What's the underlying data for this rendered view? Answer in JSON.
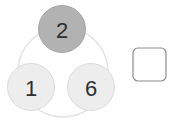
{
  "figure": {
    "type": "number-circle-puzzle",
    "background_color": "#ffffff",
    "guide_circle": {
      "name": "guide-circle",
      "cx": 63,
      "cy": 72,
      "r": 45,
      "stroke_color": "#e4e4e4",
      "stroke_width": 1.4,
      "fill": "none"
    },
    "nodes": [
      {
        "id": "node-top",
        "label": "2",
        "cx": 62,
        "cy": 29,
        "r": 23.5,
        "fill_color": "#b2b2b2",
        "stroke_color": "#a6a6a6",
        "text_color": "#2b2b2b"
      },
      {
        "id": "node-bottom-left",
        "label": "1",
        "cx": 31,
        "cy": 87,
        "r": 23.5,
        "fill_color": "#ededed",
        "stroke_color": "#dcdcdc",
        "text_color": "#2b2b2b"
      },
      {
        "id": "node-bottom-right",
        "label": "6",
        "cx": 91,
        "cy": 87,
        "r": 23.5,
        "fill_color": "#ededed",
        "stroke_color": "#dcdcdc",
        "text_color": "#2b2b2b"
      }
    ],
    "answer_box": {
      "name": "answer-box",
      "x": 133,
      "y": 48,
      "width": 33,
      "height": 33,
      "corner_radius": 5,
      "fill_color": "#ffffff",
      "stroke_color": "#8c8c8c",
      "stroke_width": 1.2,
      "value": ""
    }
  }
}
